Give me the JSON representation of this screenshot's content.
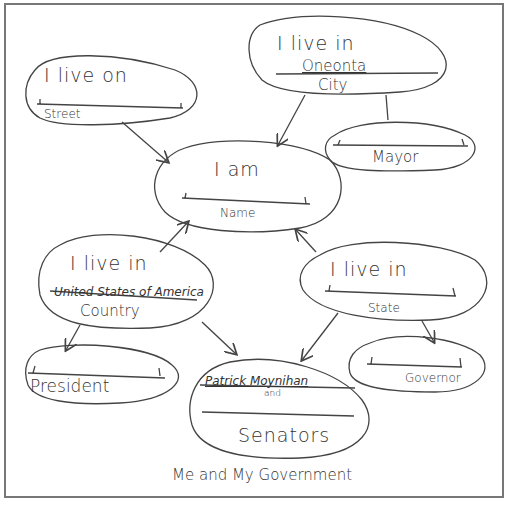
{
  "title": "Me and My Government",
  "nodes": {
    "name": {
      "prompt": "I am",
      "value": "",
      "label": "Name"
    },
    "street": {
      "prompt": "I live on",
      "value": "",
      "label": "Street"
    },
    "city": {
      "prompt": "I live in",
      "value": "Oneonta",
      "label": "City"
    },
    "mayor": {
      "value": "",
      "label": "Mayor"
    },
    "country": {
      "prompt": "I live in",
      "value": "United States of America",
      "label": "Country"
    },
    "state": {
      "prompt": "I live in",
      "value": "",
      "label": "State"
    },
    "president": {
      "value": "",
      "label": "President"
    },
    "senators": {
      "value1": "Patrick Moynihan",
      "joiner": "and",
      "value2": "",
      "label": "Senators"
    },
    "governor": {
      "value": "",
      "label": "Governor"
    }
  },
  "edges": [
    {
      "from": "street",
      "to": "name"
    },
    {
      "from": "city",
      "to": "name"
    },
    {
      "from": "city",
      "to": "mayor"
    },
    {
      "from": "country",
      "to": "name"
    },
    {
      "from": "state",
      "to": "name"
    },
    {
      "from": "country",
      "to": "president"
    },
    {
      "from": "country",
      "to": "senators"
    },
    {
      "from": "state",
      "to": "senators"
    },
    {
      "from": "state",
      "to": "governor"
    }
  ]
}
